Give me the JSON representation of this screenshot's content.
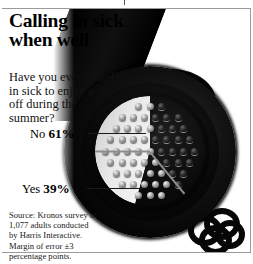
{
  "headline": "Calling in sick when well",
  "subtitle": "Have you ever called in sick to enjoy a day off during the summer?",
  "labels": {
    "no_word": "No",
    "no_pct": "61%",
    "yes_word": "Yes",
    "yes_pct": "39%"
  },
  "source": {
    "line1": "Source: Kronos survey of",
    "line2": "1,077 adults conducted",
    "line3": "by Harris Interactive.",
    "line4": "Margin of error ±3",
    "line5": "percentage points."
  },
  "illustration": {
    "subject": "headphones-photo",
    "parts": [
      "headband",
      "earcup",
      "speaker-grille-pie",
      "cord-coil"
    ]
  },
  "colors": {
    "background": "#ffffff",
    "text": "#000000",
    "frame": "#9a9a9a",
    "slice_no": "#eaeaea",
    "slice_yes": "#0a0a0a",
    "leader_line": "#1a1a1a"
  },
  "chart_data": {
    "type": "pie",
    "title": "Calling in sick when well",
    "question": "Have you ever called in sick to enjoy a day off during the summer?",
    "categories": [
      "No",
      "Yes"
    ],
    "values": [
      61,
      39
    ],
    "unit": "percent",
    "labels": [
      "No 61%",
      "Yes 39%"
    ],
    "legend": "inline-leader-labels",
    "grid": false,
    "source": "Kronos survey of 1,077 adults conducted by Harris Interactive. Margin of error ±3 percentage points.",
    "sample_size": 1077,
    "margin_of_error": 3
  }
}
